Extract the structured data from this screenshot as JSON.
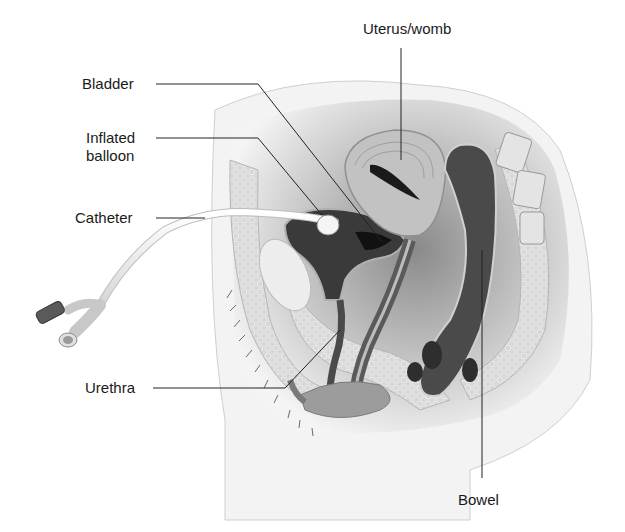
{
  "diagram": {
    "labels": {
      "uterus": "Uterus/womb",
      "bladder": "Bladder",
      "balloon_line1": "Inflated",
      "balloon_line2": "balloon",
      "catheter": "Catheter",
      "urethra": "Urethra",
      "bowel": "Bowel"
    },
    "colors": {
      "background": "#ffffff",
      "label_text": "#1a1a1a",
      "leader_line": "#222222",
      "tissue_light": "#e6e6e6",
      "tissue_mid": "#9a9a9a",
      "cavity_dark": "#3a3a3a",
      "catheter": "#f2f2f2"
    }
  }
}
